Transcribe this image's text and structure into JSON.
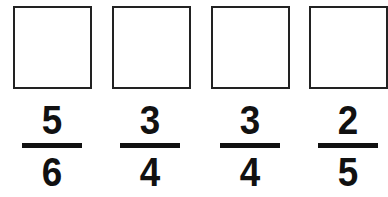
{
  "answer_boxes": [
    {
      "value": ""
    },
    {
      "value": ""
    },
    {
      "value": ""
    },
    {
      "value": ""
    }
  ],
  "fractions": [
    {
      "numerator": "5",
      "denominator": "6"
    },
    {
      "numerator": "3",
      "denominator": "4"
    },
    {
      "numerator": "3",
      "denominator": "4"
    },
    {
      "numerator": "2",
      "denominator": "5"
    }
  ]
}
